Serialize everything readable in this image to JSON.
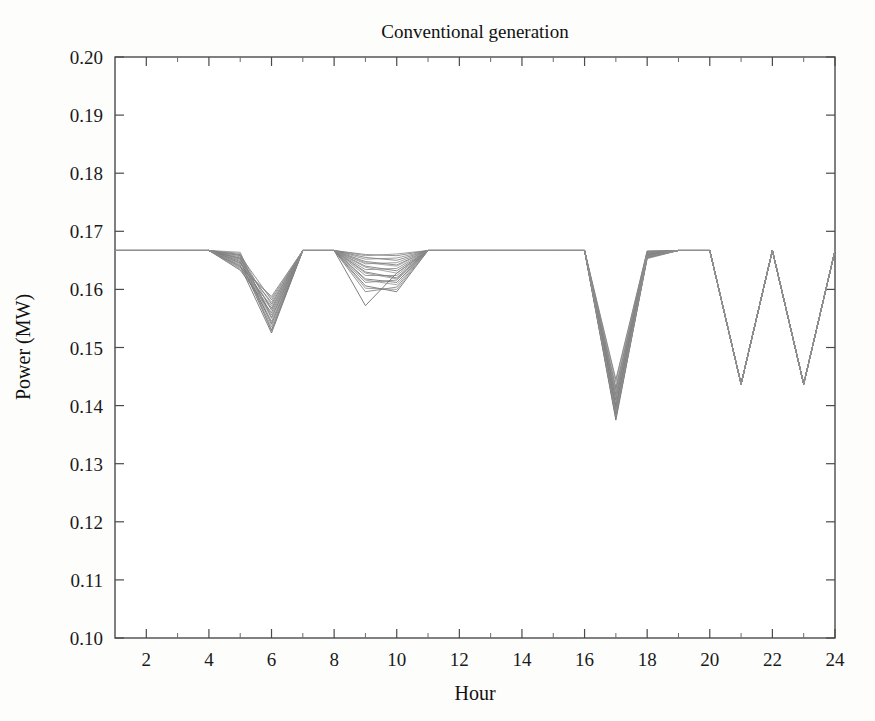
{
  "figure": {
    "background_color": "#fdfdfc",
    "ink_color": "#4a4a4a"
  },
  "chart_data": {
    "type": "line",
    "title": "Conventional generation",
    "xlabel": "Hour",
    "ylabel": "Power (MW)",
    "xlim": [
      1,
      24
    ],
    "ylim": [
      0.1,
      0.2
    ],
    "grid": false,
    "legend": null,
    "x_tick_labels": [
      "2",
      "4",
      "6",
      "8",
      "10",
      "12",
      "14",
      "16",
      "18",
      "20",
      "22",
      "24"
    ],
    "x_tick_values": [
      2,
      4,
      6,
      8,
      10,
      12,
      14,
      16,
      18,
      20,
      22,
      24
    ],
    "x_minor_tick_values": [
      3,
      5,
      7,
      9,
      11,
      13,
      15,
      17,
      19,
      21,
      23
    ],
    "y_tick_labels": [
      "0.10",
      "0.11",
      "0.12",
      "0.13",
      "0.14",
      "0.15",
      "0.16",
      "0.17",
      "0.18",
      "0.19",
      "0.20"
    ],
    "y_tick_values": [
      0.1,
      0.11,
      0.12,
      0.13,
      0.14,
      0.15,
      0.16,
      0.17,
      0.18,
      0.19,
      0.2
    ],
    "x": [
      1,
      2,
      3,
      4,
      5,
      6,
      7,
      8,
      9,
      10,
      11,
      12,
      13,
      14,
      15,
      16,
      17,
      18,
      19,
      20,
      21,
      22,
      23,
      24
    ],
    "baseline_value": 0.1667,
    "series": [
      {
        "name": "scenario-1",
        "color": "#555555",
        "width": 0.9,
        "values": [
          0.1667,
          0.1667,
          0.1667,
          0.1667,
          0.164,
          0.1525,
          0.1667,
          0.1667,
          0.1572,
          0.1628,
          0.1667,
          0.1667,
          0.1667,
          0.1667,
          0.1667,
          0.1667,
          0.1375,
          0.1655,
          0.1667,
          0.1667,
          0.1437,
          0.1667,
          0.1437,
          0.1667
        ]
      },
      {
        "name": "scenario-2",
        "color": "#5a5a5a",
        "width": 0.9,
        "values": [
          0.1667,
          0.1667,
          0.1667,
          0.1667,
          0.1648,
          0.153,
          0.1667,
          0.1667,
          0.1606,
          0.1596,
          0.1667,
          0.1667,
          0.1667,
          0.1667,
          0.1667,
          0.1667,
          0.1392,
          0.166,
          0.1667,
          0.1667,
          0.1437,
          0.1667,
          0.1437,
          0.1667
        ]
      },
      {
        "name": "scenario-3",
        "color": "#606060",
        "width": 0.9,
        "values": [
          0.1667,
          0.1667,
          0.1667,
          0.1667,
          0.1654,
          0.154,
          0.1667,
          0.1667,
          0.1618,
          0.1612,
          0.1667,
          0.1667,
          0.1667,
          0.1667,
          0.1667,
          0.1667,
          0.141,
          0.1662,
          0.1667,
          0.1667,
          0.1437,
          0.1667,
          0.1437,
          0.1667
        ]
      },
      {
        "name": "scenario-4",
        "color": "#636363",
        "width": 0.9,
        "values": [
          0.1667,
          0.1667,
          0.1667,
          0.1667,
          0.166,
          0.1552,
          0.1667,
          0.1667,
          0.163,
          0.162,
          0.1667,
          0.1667,
          0.1667,
          0.1667,
          0.1667,
          0.1667,
          0.1428,
          0.1664,
          0.1667,
          0.1667,
          0.1437,
          0.1667,
          0.1437,
          0.1667
        ]
      },
      {
        "name": "scenario-5",
        "color": "#666666",
        "width": 0.9,
        "values": [
          0.1667,
          0.1667,
          0.1667,
          0.1667,
          0.1633,
          0.156,
          0.1667,
          0.1667,
          0.164,
          0.1632,
          0.1667,
          0.1667,
          0.1667,
          0.1667,
          0.1667,
          0.1667,
          0.1445,
          0.1666,
          0.1667,
          0.1667,
          0.1437,
          0.1667,
          0.1437,
          0.1667
        ]
      },
      {
        "name": "scenario-6",
        "color": "#696969",
        "width": 0.9,
        "values": [
          0.1667,
          0.1667,
          0.1667,
          0.1667,
          0.1645,
          0.1568,
          0.1667,
          0.1667,
          0.1648,
          0.1642,
          0.1667,
          0.1667,
          0.1667,
          0.1667,
          0.1667,
          0.1667,
          0.1398,
          0.1658,
          0.1667,
          0.1667,
          0.1437,
          0.1667,
          0.1437,
          0.1667
        ]
      },
      {
        "name": "scenario-7",
        "color": "#6c6c6c",
        "width": 0.9,
        "values": [
          0.1667,
          0.1667,
          0.1667,
          0.1667,
          0.1652,
          0.1575,
          0.1667,
          0.1667,
          0.1655,
          0.165,
          0.1667,
          0.1667,
          0.1667,
          0.1667,
          0.1667,
          0.1667,
          0.1385,
          0.1656,
          0.1667,
          0.1667,
          0.1437,
          0.1667,
          0.1437,
          0.1667
        ]
      },
      {
        "name": "scenario-8",
        "color": "#6f6f6f",
        "width": 0.9,
        "values": [
          0.1667,
          0.1667,
          0.1667,
          0.1667,
          0.1658,
          0.1582,
          0.1667,
          0.1667,
          0.166,
          0.1658,
          0.1667,
          0.1667,
          0.1667,
          0.1667,
          0.1667,
          0.1667,
          0.138,
          0.1654,
          0.1667,
          0.1667,
          0.1437,
          0.1667,
          0.1437,
          0.1667
        ]
      },
      {
        "name": "scenario-9",
        "color": "#727272",
        "width": 0.9,
        "values": [
          0.1667,
          0.1667,
          0.1667,
          0.1667,
          0.1638,
          0.1588,
          0.1667,
          0.1667,
          0.1596,
          0.1604,
          0.1667,
          0.1667,
          0.1667,
          0.1667,
          0.1667,
          0.1667,
          0.142,
          0.1663,
          0.1667,
          0.1667,
          0.1437,
          0.1667,
          0.1437,
          0.1667
        ]
      },
      {
        "name": "scenario-10",
        "color": "#757575",
        "width": 0.9,
        "values": [
          0.1667,
          0.1667,
          0.1667,
          0.1667,
          0.1642,
          0.1545,
          0.1667,
          0.1667,
          0.1612,
          0.1616,
          0.1667,
          0.1667,
          0.1667,
          0.1667,
          0.1667,
          0.1667,
          0.1402,
          0.1659,
          0.1667,
          0.1667,
          0.1437,
          0.1667,
          0.1437,
          0.1667
        ]
      },
      {
        "name": "scenario-11",
        "color": "#787878",
        "width": 0.9,
        "values": [
          0.1667,
          0.1667,
          0.1667,
          0.1667,
          0.165,
          0.1535,
          0.1667,
          0.1667,
          0.1624,
          0.1624,
          0.1667,
          0.1667,
          0.1667,
          0.1667,
          0.1667,
          0.1667,
          0.1388,
          0.1657,
          0.1667,
          0.1667,
          0.1437,
          0.1667,
          0.1437,
          0.1667
        ]
      },
      {
        "name": "scenario-12",
        "color": "#7b7b7b",
        "width": 0.9,
        "values": [
          0.1667,
          0.1667,
          0.1667,
          0.1667,
          0.1656,
          0.1556,
          0.1667,
          0.1667,
          0.1634,
          0.1636,
          0.1667,
          0.1667,
          0.1667,
          0.1667,
          0.1667,
          0.1667,
          0.1416,
          0.1661,
          0.1667,
          0.1667,
          0.1437,
          0.1667,
          0.1437,
          0.1667
        ]
      },
      {
        "name": "scenario-13",
        "color": "#7e7e7e",
        "width": 0.9,
        "values": [
          0.1667,
          0.1667,
          0.1667,
          0.1667,
          0.1662,
          0.1564,
          0.1667,
          0.1667,
          0.1644,
          0.1646,
          0.1667,
          0.1667,
          0.1667,
          0.1667,
          0.1667,
          0.1667,
          0.1432,
          0.1665,
          0.1667,
          0.1667,
          0.1437,
          0.1667,
          0.1437,
          0.1667
        ]
      },
      {
        "name": "scenario-14",
        "color": "#808080",
        "width": 0.9,
        "values": [
          0.1667,
          0.1667,
          0.1667,
          0.1667,
          0.1636,
          0.1572,
          0.1667,
          0.1667,
          0.1652,
          0.1654,
          0.1667,
          0.1667,
          0.1667,
          0.1667,
          0.1667,
          0.1667,
          0.1395,
          0.1658,
          0.1667,
          0.1667,
          0.1437,
          0.1667,
          0.1437,
          0.1667
        ]
      },
      {
        "name": "scenario-15",
        "color": "#838383",
        "width": 0.9,
        "values": [
          0.1667,
          0.1667,
          0.1667,
          0.1667,
          0.1646,
          0.1578,
          0.1667,
          0.1667,
          0.1658,
          0.1661,
          0.1667,
          0.1667,
          0.1667,
          0.1667,
          0.1667,
          0.1667,
          0.1378,
          0.1653,
          0.1667,
          0.1667,
          0.1437,
          0.1667,
          0.1437,
          0.1667
        ]
      },
      {
        "name": "scenario-16",
        "color": "#868686",
        "width": 0.9,
        "values": [
          0.1667,
          0.1667,
          0.1667,
          0.1667,
          0.1653,
          0.155,
          0.1667,
          0.1667,
          0.1602,
          0.16,
          0.1667,
          0.1667,
          0.1667,
          0.1667,
          0.1667,
          0.1667,
          0.1408,
          0.166,
          0.1667,
          0.1667,
          0.1437,
          0.1667,
          0.1437,
          0.1667
        ]
      },
      {
        "name": "scenario-17",
        "color": "#898989",
        "width": 0.9,
        "values": [
          0.1667,
          0.1667,
          0.1667,
          0.1667,
          0.1659,
          0.1528,
          0.1667,
          0.1667,
          0.1616,
          0.1608,
          0.1667,
          0.1667,
          0.1667,
          0.1667,
          0.1667,
          0.1667,
          0.144,
          0.1666,
          0.1667,
          0.1667,
          0.1437,
          0.1667,
          0.1437,
          0.1667
        ]
      },
      {
        "name": "scenario-18",
        "color": "#8c8c8c",
        "width": 0.9,
        "values": [
          0.1667,
          0.1667,
          0.1667,
          0.1667,
          0.1664,
          0.1542,
          0.1667,
          0.1667,
          0.1628,
          0.1618,
          0.1667,
          0.1667,
          0.1667,
          0.1667,
          0.1667,
          0.1667,
          0.1382,
          0.1655,
          0.1667,
          0.1667,
          0.1437,
          0.1667,
          0.1437,
          0.1667
        ]
      },
      {
        "name": "scenario-19",
        "color": "#8f8f8f",
        "width": 0.9,
        "values": [
          0.1667,
          0.1667,
          0.1667,
          0.1667,
          0.1634,
          0.1566,
          0.1667,
          0.1667,
          0.1638,
          0.1628,
          0.1667,
          0.1667,
          0.1667,
          0.1667,
          0.1667,
          0.1667,
          0.1424,
          0.1663,
          0.1667,
          0.1667,
          0.1437,
          0.1667,
          0.1437,
          0.1667
        ]
      },
      {
        "name": "scenario-20",
        "color": "#929292",
        "width": 0.9,
        "values": [
          0.1667,
          0.1667,
          0.1667,
          0.1667,
          0.1644,
          0.1585,
          0.1667,
          0.1667,
          0.1646,
          0.164,
          0.1667,
          0.1667,
          0.1667,
          0.1667,
          0.1667,
          0.1667,
          0.139,
          0.1657,
          0.1667,
          0.1667,
          0.1437,
          0.1667,
          0.1437,
          0.1667
        ]
      }
    ],
    "annotations": [
      {
        "label": "flat baseline 0.1667 MW over most hours"
      },
      {
        "label": "dip cluster hours 5-7 minimum ~0.1525"
      },
      {
        "label": "dip cluster hours 8-11 minimum ~0.1572"
      },
      {
        "label": "deep dip hour 17 minimum ~0.1375"
      },
      {
        "label": "zigzag hours 20-24 minima ~0.1437 at hours 21 and 23"
      }
    ]
  }
}
